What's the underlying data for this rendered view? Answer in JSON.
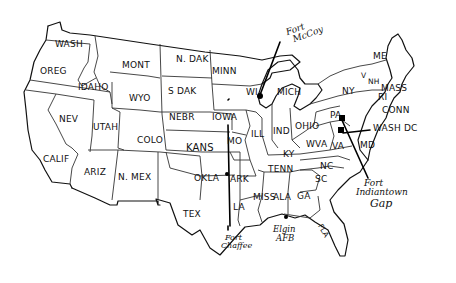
{
  "map": {
    "title": "",
    "style": "hand-drawn outline map of the contiguous United States",
    "ink_color": "#111111",
    "background": "#ffffff",
    "states": [
      {
        "id": "wa",
        "label": "WASH"
      },
      {
        "id": "or",
        "label": "OREG"
      },
      {
        "id": "id",
        "label": "IDAHO"
      },
      {
        "id": "mt",
        "label": "MONT"
      },
      {
        "id": "wy",
        "label": "WYO"
      },
      {
        "id": "nv",
        "label": "NEV"
      },
      {
        "id": "ut",
        "label": "UTAH"
      },
      {
        "id": "co",
        "label": "COLO"
      },
      {
        "id": "ca",
        "label": "CALIF"
      },
      {
        "id": "az",
        "label": "ARIZ"
      },
      {
        "id": "nm",
        "label": "N. MEX"
      },
      {
        "id": "nd",
        "label": "N. DAK"
      },
      {
        "id": "sd",
        "label": "S DAK"
      },
      {
        "id": "ne",
        "label": "NEBR"
      },
      {
        "id": "ks",
        "label": "KANS"
      },
      {
        "id": "ok",
        "label": "OKLA"
      },
      {
        "id": "tx",
        "label": "TEX"
      },
      {
        "id": "mn",
        "label": "MINN"
      },
      {
        "id": "ia",
        "label": "IOWA"
      },
      {
        "id": "mo",
        "label": "MO"
      },
      {
        "id": "ar",
        "label": "ARK"
      },
      {
        "id": "la",
        "label": "LA"
      },
      {
        "id": "wi",
        "label": "WI"
      },
      {
        "id": "il",
        "label": "ILL"
      },
      {
        "id": "mi",
        "label": "MICH"
      },
      {
        "id": "in",
        "label": "IND"
      },
      {
        "id": "oh",
        "label": "OHIO"
      },
      {
        "id": "ky",
        "label": "KY"
      },
      {
        "id": "tn",
        "label": "TENN"
      },
      {
        "id": "ms",
        "label": "MISS"
      },
      {
        "id": "al",
        "label": "ALA"
      },
      {
        "id": "ga",
        "label": "GA"
      },
      {
        "id": "fl",
        "label": "FLA"
      },
      {
        "id": "sc",
        "label": "SC"
      },
      {
        "id": "nc",
        "label": "NC"
      },
      {
        "id": "va",
        "label": "VA"
      },
      {
        "id": "wv",
        "label": "WVA"
      },
      {
        "id": "md",
        "label": "MD"
      },
      {
        "id": "pa",
        "label": "PA"
      },
      {
        "id": "ny",
        "label": "NY"
      },
      {
        "id": "vt",
        "label": "V"
      },
      {
        "id": "nh",
        "label": "NH"
      },
      {
        "id": "me",
        "label": "ME"
      },
      {
        "id": "ma",
        "label": "MASS"
      },
      {
        "id": "ri",
        "label": "RI"
      },
      {
        "id": "ct",
        "label": "CONN"
      },
      {
        "id": "dc",
        "label": "WASH DC"
      }
    ],
    "locations": [
      {
        "id": "fort-mccoy",
        "label_line1": "Fort",
        "label_line2": "McCoy",
        "state": "WI"
      },
      {
        "id": "fort-indiantown-gap",
        "label_line1": "Fort",
        "label_line2": "Indiantown",
        "label_line3": "Gap",
        "state": "PA"
      },
      {
        "id": "fort-chaffee",
        "label_line1": "Fort",
        "label_line2": "Chaffee",
        "state": "ARK"
      },
      {
        "id": "elgin-afb",
        "label_line1": "Elgin",
        "label_line2": "AFB",
        "state": "FLA"
      }
    ]
  }
}
